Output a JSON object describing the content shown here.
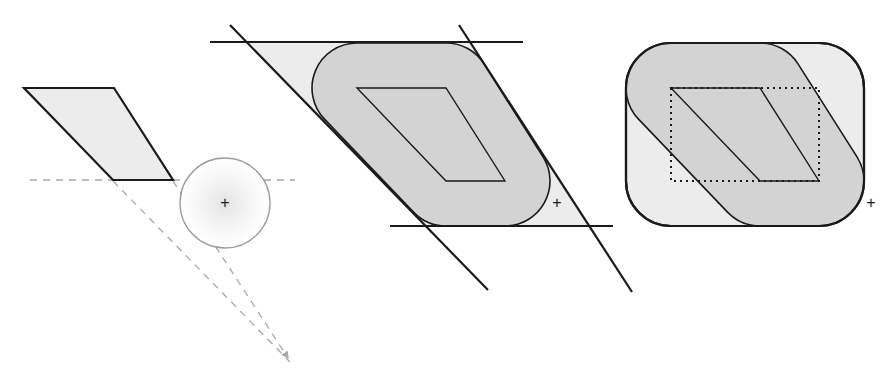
{
  "diagram": {
    "colors": {
      "background": "#ffffff",
      "light_fill": "#ececec",
      "dark_fill": "#d3d3d3",
      "stroke": "#1a1a1a",
      "dashed": "#a8a8a8",
      "circle_stroke": "#9a9a9a"
    },
    "panel_left": {
      "parallelogram": [
        [
          24,
          88
        ],
        [
          114,
          88
        ],
        [
          173,
          180
        ],
        [
          113,
          180
        ]
      ],
      "circle": {
        "cx": 225,
        "cy": 203,
        "r": 45
      },
      "center_marker": "+",
      "horizontal_dashed_line": {
        "x1": 30,
        "y": 180,
        "x2": 295
      },
      "converging_dashed_lines": [
        [
          [
            113,
            180
          ],
          [
            290,
            362
          ]
        ],
        [
          [
            173,
            180
          ],
          [
            290,
            362
          ]
        ]
      ]
    },
    "panel_middle": {
      "inner_parallelogram": [
        [
          357,
          88
        ],
        [
          446,
          88
        ],
        [
          505,
          181
        ],
        [
          446,
          181
        ]
      ],
      "offset_radius": 45,
      "top_line": {
        "x1": 210,
        "y": 42,
        "x2": 523
      },
      "bottom_line": {
        "x1": 390,
        "y": 226,
        "x2": 613
      },
      "left_diagonal": [
        [
          230,
          25
        ],
        [
          488,
          290
        ]
      ],
      "right_diagonal": [
        [
          459,
          25
        ],
        [
          632,
          292
        ]
      ],
      "marker": {
        "x": 557,
        "y": 203,
        "symbol": "+"
      }
    },
    "panel_right": {
      "inner_parallelogram": [
        [
          671,
          88
        ],
        [
          760,
          88
        ],
        [
          819,
          181
        ],
        [
          760,
          181
        ]
      ],
      "dotted_bounding_box": {
        "x": 671,
        "y": 88,
        "w": 148,
        "h": 93
      },
      "rounded_rect": {
        "x": 626,
        "y": 43,
        "w": 238,
        "h": 183,
        "r": 45
      },
      "marker": {
        "x": 870,
        "y": 203,
        "symbol": "+"
      }
    }
  },
  "labels": {
    "marker_left": "+",
    "marker_middle": "+",
    "marker_right": "+"
  }
}
